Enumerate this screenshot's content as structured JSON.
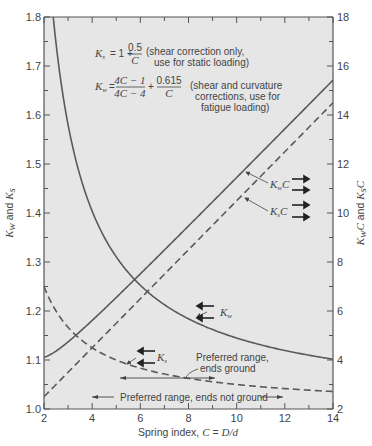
{
  "chart_data": {
    "type": "line",
    "title": "",
    "xlabel": "Spring index, C = D/d",
    "ylabel_left": "K_w and K_s",
    "ylabel_right": "K_w C and K_s C",
    "xlim": [
      2,
      14
    ],
    "ylim_left": [
      1.0,
      1.8
    ],
    "ylim_right": [
      2,
      18
    ],
    "x_ticks": [
      "2",
      "4",
      "6",
      "8",
      "10",
      "12",
      "14"
    ],
    "y_ticks_left": [
      "1.0",
      "1.1",
      "1.2",
      "1.3",
      "1.4",
      "1.5",
      "1.6",
      "1.7",
      "1.8"
    ],
    "y_ticks_right": [
      "2",
      "4",
      "6",
      "8",
      "10",
      "12",
      "14",
      "16",
      "18"
    ],
    "grid": false,
    "x": [
      2,
      3,
      4,
      5,
      6,
      7,
      8,
      9,
      10,
      11,
      12,
      13,
      14
    ],
    "series": [
      {
        "name": "K_w",
        "axis": "left",
        "style": "solid",
        "values": [
          1.81,
          1.45,
          1.4,
          1.31,
          1.25,
          1.21,
          1.18,
          1.16,
          1.14,
          1.13,
          1.12,
          1.11,
          1.1
        ]
      },
      {
        "name": "K_s",
        "axis": "left",
        "style": "dashed",
        "values": [
          1.25,
          1.167,
          1.125,
          1.1,
          1.083,
          1.071,
          1.063,
          1.056,
          1.05,
          1.045,
          1.042,
          1.038,
          1.036
        ]
      },
      {
        "name": "K_w C",
        "axis": "right",
        "style": "solid",
        "values": [
          3.6,
          4.4,
          5.4,
          6.6,
          7.6,
          8.5,
          9.4,
          10.5,
          11.4,
          12.4,
          13.5,
          14.5,
          15.4
        ]
      },
      {
        "name": "K_s C",
        "axis": "right",
        "style": "dashed",
        "values": [
          2.5,
          3.5,
          4.5,
          5.5,
          6.5,
          7.5,
          8.5,
          9.5,
          10.5,
          11.5,
          12.5,
          13.5,
          14.5
        ]
      }
    ],
    "annotations": {
      "ks_formula_lhs": "K",
      "ks_formula_sub": "s",
      "ks_formula_eq": "= 1 +",
      "ks_formula_num": "0.5",
      "ks_formula_den": "C",
      "ks_note_line1": "(shear correction only,",
      "ks_note_line2": "use for static loading)",
      "kw_formula_lhs": "K",
      "kw_formula_sub": "w",
      "kw_formula_eq": "=",
      "kw_formula_num1": "4C − 1",
      "kw_formula_den1": "4C − 4",
      "kw_formula_plus": "+",
      "kw_formula_num2": "0.615",
      "kw_formula_den2": "C",
      "kw_note_line1": "(shear and curvature",
      "kw_note_line2": "corrections, use for",
      "kw_note_line3": "fatigue loading)",
      "label_kwc": "K",
      "label_kwc_sub": "w",
      "label_kwc_tail": "C",
      "label_ksc": "K",
      "label_ksc_sub": "s",
      "label_ksc_tail": "C",
      "label_kw": "K",
      "label_kw_sub": "w",
      "label_ks": "K",
      "label_ks_sub": "s",
      "preferred_ground_line1": "Preferred range,",
      "preferred_ground_line2": "ends  ground",
      "preferred_not_ground": "Preferred range, ends not ground"
    },
    "colors": {
      "plot_bg": "#e6e6e6",
      "line": "#5a5a5a",
      "axis": "#555555",
      "text": "#444444"
    }
  }
}
